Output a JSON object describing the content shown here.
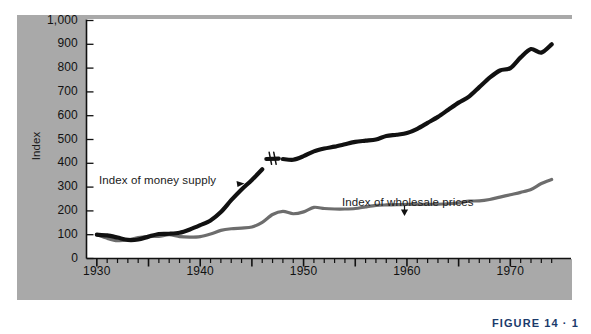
{
  "figure": {
    "caption": "FIGURE 14 · 1",
    "caption_color": "#1b3a6b",
    "panel_color": "#a9a9a9",
    "plot_background": "#ffffff"
  },
  "labels": {
    "money_supply": "Index of money supply",
    "wholesale_prices": "Index of wholesale prices",
    "y_axis_title": "Index"
  },
  "chart_data": {
    "type": "line",
    "title": "",
    "subtitle": "",
    "xlabel": "",
    "ylabel": "Index",
    "xlim": [
      1929,
      1975
    ],
    "ylim": [
      0,
      1000
    ],
    "grid": false,
    "legend_position": "inline-annotations",
    "y_ticks": [
      "0",
      "100",
      "200",
      "300",
      "400",
      "500",
      "600",
      "700",
      "800",
      "900",
      "1,000"
    ],
    "y_tick_values": [
      0,
      100,
      200,
      300,
      400,
      500,
      600,
      700,
      800,
      900,
      1000
    ],
    "x_ticks": [
      "1930",
      "1940",
      "1950",
      "1960",
      "1970"
    ],
    "x_tick_values": [
      1930,
      1940,
      1950,
      1960,
      1970
    ],
    "x_minor_tick_interval": 1,
    "x_major_tick_interval": 5,
    "annotations": [
      {
        "text": "Index of money supply",
        "x": 1937.5,
        "y": 355,
        "pointer": "arrow-right-down"
      },
      {
        "text": "Index of wholesale prices",
        "x": 1958.5,
        "y": 250,
        "pointer": "arrow-down"
      },
      {
        "text": "series-break",
        "x": 1947,
        "y": 420,
        "pointer": "double-slash"
      }
    ],
    "series": [
      {
        "name": "Index of money supply",
        "color": "#111111",
        "width": 4.2,
        "break_at": 1947,
        "x": [
          1930,
          1931,
          1932,
          1933,
          1934,
          1935,
          1936,
          1937,
          1938,
          1939,
          1940,
          1941,
          1942,
          1943,
          1944,
          1945,
          1946,
          1947,
          1948,
          1949,
          1950,
          1951,
          1952,
          1953,
          1954,
          1955,
          1956,
          1957,
          1958,
          1959,
          1960,
          1961,
          1962,
          1963,
          1964,
          1965,
          1966,
          1967,
          1968,
          1969,
          1970,
          1971,
          1972,
          1973,
          1974
        ],
        "values": [
          100,
          97,
          88,
          78,
          80,
          92,
          103,
          104,
          108,
          122,
          140,
          160,
          195,
          245,
          290,
          330,
          375,
          420,
          418,
          415,
          430,
          450,
          462,
          470,
          480,
          490,
          495,
          500,
          515,
          520,
          527,
          545,
          570,
          595,
          625,
          655,
          680,
          720,
          760,
          790,
          800,
          845,
          880,
          865,
          900
        ]
      },
      {
        "name": "Index of wholesale prices",
        "color": "#6d6d6d",
        "width": 3.2,
        "x": [
          1930,
          1931,
          1932,
          1933,
          1934,
          1935,
          1936,
          1937,
          1938,
          1939,
          1940,
          1941,
          1942,
          1943,
          1944,
          1945,
          1946,
          1947,
          1948,
          1949,
          1950,
          1951,
          1952,
          1953,
          1954,
          1955,
          1956,
          1957,
          1958,
          1959,
          1960,
          1961,
          1962,
          1963,
          1964,
          1965,
          1966,
          1967,
          1968,
          1969,
          1970,
          1971,
          1972,
          1973,
          1974
        ],
        "values": [
          100,
          85,
          75,
          78,
          88,
          92,
          93,
          100,
          92,
          90,
          92,
          103,
          118,
          125,
          128,
          132,
          152,
          185,
          198,
          188,
          196,
          215,
          210,
          208,
          208,
          210,
          217,
          223,
          225,
          226,
          227,
          227,
          228,
          228,
          230,
          234,
          241,
          242,
          248,
          258,
          268,
          278,
          290,
          315,
          332
        ]
      }
    ]
  }
}
